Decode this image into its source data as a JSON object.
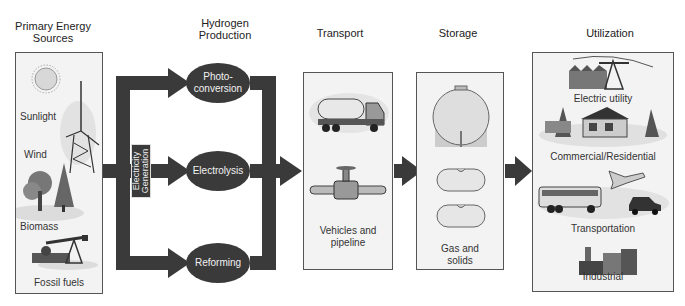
{
  "headers": {
    "sources": [
      "Primary Energy",
      "Sources"
    ],
    "production": [
      "Hydrogen",
      "Production"
    ],
    "transport": "Transport",
    "storage": "Storage",
    "utilization": "Utilization"
  },
  "sources": {
    "items": [
      {
        "label": "Sunlight",
        "icon": "sun-icon"
      },
      {
        "label": "Wind",
        "icon": "wind-turbine-icon"
      },
      {
        "label": "Biomass",
        "icon": "trees-icon"
      },
      {
        "label": "Fossil fuels",
        "icon": "oil-pump-icon"
      }
    ]
  },
  "electricity_generation": [
    "Electricity",
    "Generation"
  ],
  "production": {
    "processes": [
      {
        "label": [
          "Photo-",
          "conversion"
        ]
      },
      {
        "label": [
          "Electrolysis"
        ]
      },
      {
        "label": [
          "Reforming"
        ]
      }
    ]
  },
  "transport": {
    "label": [
      "Vehicles and",
      "pipeline"
    ],
    "icons": [
      "tanker-truck-icon",
      "pipeline-valve-icon"
    ]
  },
  "storage": {
    "label": [
      "Gas and",
      "solids"
    ],
    "icons": [
      "spherical-tank-icon",
      "cylinder-tank-icon"
    ]
  },
  "utilization": {
    "items": [
      {
        "label": "Electric utility",
        "icon": "power-plant-icon"
      },
      {
        "label": "Commercial/Residential",
        "icon": "house-icon"
      },
      {
        "label": "Transportation",
        "icon": "vehicles-icon"
      },
      {
        "label": "Industrial",
        "icon": "factory-icon"
      }
    ]
  },
  "colors": {
    "arrow": "#3a3a3a",
    "panel": "#f3f3f3",
    "panel_border": "#555555"
  }
}
